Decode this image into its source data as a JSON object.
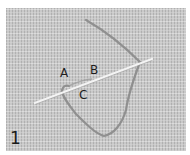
{
  "figure": {
    "step_number": "1",
    "points": [
      {
        "id": "a",
        "label": "A"
      },
      {
        "id": "b",
        "label": "B"
      },
      {
        "id": "c",
        "label": "C"
      }
    ],
    "colors": {
      "fabric": "#c9c9c9",
      "thread": "#8a8a8a",
      "needle": "#f2f2f2",
      "label": "#1e1e1e"
    }
  }
}
